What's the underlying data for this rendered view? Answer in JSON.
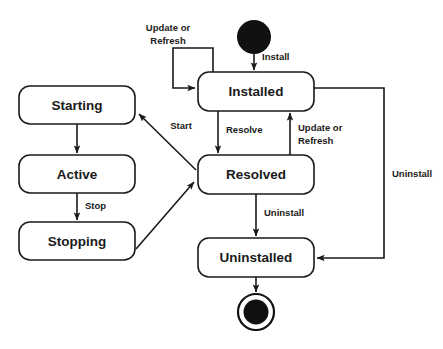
{
  "diagram": {
    "type": "uml-state-machine",
    "background_color": "#ffffff",
    "stroke_color": "#1a1a1a",
    "states": [
      {
        "id": "starting",
        "label": "Starting",
        "x": 19,
        "y": 86,
        "w": 116,
        "h": 38
      },
      {
        "id": "active",
        "label": "Active",
        "x": 19,
        "y": 155,
        "w": 116,
        "h": 38
      },
      {
        "id": "stopping",
        "label": "Stopping",
        "x": 19,
        "y": 222,
        "w": 116,
        "h": 38
      },
      {
        "id": "installed",
        "label": "Installed",
        "x": 198,
        "y": 72,
        "w": 116,
        "h": 39
      },
      {
        "id": "resolved",
        "label": "Resolved",
        "x": 198,
        "y": 155,
        "w": 116,
        "h": 39
      },
      {
        "id": "uninstalled",
        "label": "Uninstalled",
        "x": 198,
        "y": 238,
        "w": 116,
        "h": 39
      }
    ],
    "pseudostates": [
      {
        "id": "initial",
        "kind": "initial-state",
        "cx": 254,
        "cy": 37,
        "r": 17
      },
      {
        "id": "final",
        "kind": "final-state",
        "cx": 256,
        "cy": 312,
        "r_outer": 18,
        "r_inner": 12.5
      }
    ],
    "transitions": [
      {
        "id": "t-install",
        "from": "initial",
        "to": "installed",
        "label": "Install"
      },
      {
        "id": "t-installed-self",
        "from": "installed",
        "to": "installed",
        "label": "Update or\nRefresh",
        "label_line1": "Update or",
        "label_line2": "Refresh"
      },
      {
        "id": "t-resolve",
        "from": "installed",
        "to": "resolved",
        "label": "Resolve"
      },
      {
        "id": "t-update-refresh-back",
        "from": "resolved",
        "to": "installed",
        "label": "Update or\nRefresh",
        "label_line1": "Update or",
        "label_line2": "Refresh"
      },
      {
        "id": "t-uninstall-resolved",
        "from": "resolved",
        "to": "uninstalled",
        "label": "Uninstall"
      },
      {
        "id": "t-uninstall-installed",
        "from": "installed",
        "to": "uninstalled",
        "label": "Uninstall"
      },
      {
        "id": "t-start",
        "from": "resolved",
        "to": "starting",
        "label": "Start"
      },
      {
        "id": "t-starting-active",
        "from": "starting",
        "to": "active",
        "label": ""
      },
      {
        "id": "t-stop",
        "from": "active",
        "to": "stopping",
        "label": "Stop"
      },
      {
        "id": "t-stopping-resolved",
        "from": "stopping",
        "to": "resolved",
        "label": ""
      },
      {
        "id": "t-final",
        "from": "uninstalled",
        "to": "final",
        "label": ""
      }
    ]
  }
}
